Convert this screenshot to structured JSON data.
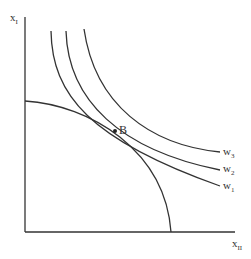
{
  "diagram": {
    "axes": {
      "y_label": "x",
      "y_label_sub": "I",
      "x_label": "x",
      "x_label_sub": "II"
    },
    "curves": [
      {
        "name": "w",
        "sub": "1"
      },
      {
        "name": "w",
        "sub": "2"
      },
      {
        "name": "w",
        "sub": "3"
      }
    ],
    "point": {
      "label": "B"
    },
    "colors": {
      "line": "#333333",
      "background": "#ffffff"
    }
  }
}
